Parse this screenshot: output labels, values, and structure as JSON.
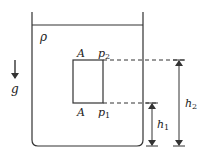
{
  "diagram": {
    "labels": {
      "density": "ρ",
      "gravity": "g",
      "area_top": "A",
      "area_bottom": "A",
      "pressure_top": "p",
      "pressure_top_sub": "2",
      "pressure_bottom": "p",
      "pressure_bottom_sub": "1",
      "height_1": "h",
      "height_1_sub": "1",
      "height_2": "h",
      "height_2_sub": "2"
    },
    "colors": {
      "stroke": "#333333",
      "background": "#ffffff"
    }
  }
}
